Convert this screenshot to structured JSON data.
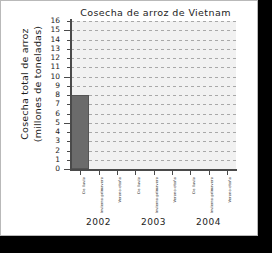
{
  "chart_data": {
    "type": "bar",
    "title": "Cosecha de arroz de Vietnam",
    "xlabel": "",
    "ylabel": "Cosecha total de arroz (millones de toneladas)",
    "ylabel_line1": "Cosecha total de arroz",
    "ylabel_line2": "(millones de toneladas)",
    "ylim": [
      0,
      16
    ],
    "ytick_step": 1,
    "yticks": [
      0,
      1,
      2,
      3,
      4,
      5,
      6,
      7,
      8,
      9,
      10,
      11,
      12,
      13,
      14,
      15,
      16
    ],
    "grid": true,
    "legend": "none",
    "bar_color": "#6b6b6b",
    "plot_background": "#f1f1f1",
    "groups": [
      "2002",
      "2003",
      "2004"
    ],
    "seasons": [
      "De lluvia",
      "Invierno-primavera",
      "Verano-otoño"
    ],
    "categories": [
      "2002 De lluvia",
      "2002 Invierno-primavera",
      "2002 Verano-otoño",
      "2003 De lluvia",
      "2003 Invierno-primavera",
      "2003 Verano-otoño",
      "2004 De lluvia",
      "2004 Invierno-primavera",
      "2004 Verano-otoño"
    ],
    "values": [
      8,
      null,
      null,
      null,
      null,
      null,
      null,
      null,
      null
    ],
    "tick_labels": [
      "De lluvia",
      "Invierno-primavera",
      "Verano-otoño",
      "De lluvia",
      "Invierno-primavera",
      "Verano-otoño",
      "De lluvia",
      "Invierno-primavera",
      "Verano-otoño"
    ]
  }
}
